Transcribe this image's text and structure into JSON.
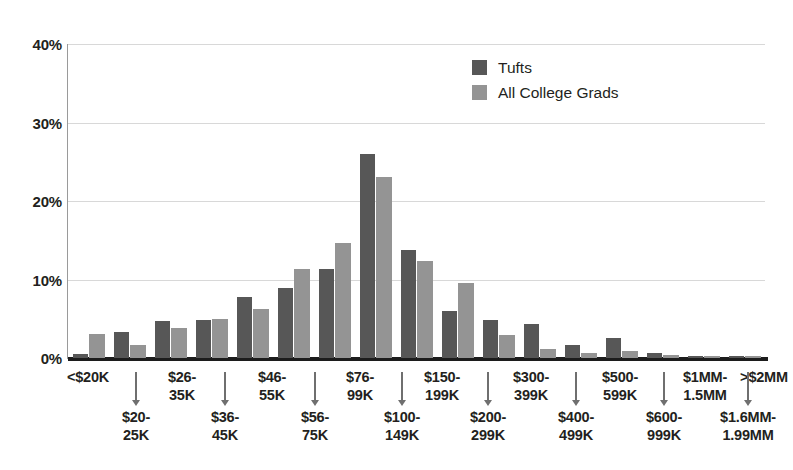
{
  "chart_data": {
    "type": "bar",
    "title": "",
    "xlabel": "",
    "ylabel": "",
    "ylim": [
      0,
      40
    ],
    "yticks": [
      0,
      10,
      20,
      30,
      40
    ],
    "ytick_labels": [
      "0%",
      "10%",
      "20%",
      "30%",
      "40%"
    ],
    "grid": true,
    "legend_position": "top-right",
    "categories": [
      "<$20K",
      "$20-25K",
      "$26-35K",
      "$36-45K",
      "$46-55K",
      "$56-75K",
      "$76-99K",
      "$100-149K",
      "$150-199K",
      "$200-299K",
      "$300-399K",
      "$400-499K",
      "$500-599K",
      "$600-999K",
      "$1MM-1.5MM",
      "$1.6MM-1.99MM",
      ">$2MM"
    ],
    "series": [
      {
        "name": "Tufts",
        "color": "#575757",
        "values": [
          0.5,
          3.3,
          4.7,
          4.8,
          7.8,
          8.9,
          11.3,
          26.0,
          13.7,
          6.0,
          4.8,
          4.3,
          1.7,
          2.5,
          0.7,
          0.2,
          0.2
        ]
      },
      {
        "name": "All College Grads",
        "color": "#949494",
        "values": [
          3.0,
          1.7,
          3.8,
          5.0,
          6.2,
          11.3,
          14.7,
          23.0,
          12.3,
          9.5,
          2.9,
          1.2,
          0.6,
          0.9,
          0.4,
          0.2,
          0.3
        ]
      }
    ]
  },
  "axis": {
    "y_ticks": [
      {
        "label": "40%",
        "value": 40
      },
      {
        "label": "30%",
        "value": 30
      },
      {
        "label": "20%",
        "value": 20
      },
      {
        "label": "10%",
        "value": 10
      },
      {
        "label": "0%",
        "value": 0
      }
    ]
  },
  "legend": {
    "items": [
      {
        "label": "Tufts",
        "color": "#575757"
      },
      {
        "label": "All College Grads",
        "color": "#949494"
      }
    ]
  },
  "x_axis_labels": {
    "top_row": [
      {
        "text": "<$20K",
        "center": 88
      },
      {
        "text": "$26-\n35K",
        "line1": "$26-",
        "line2": "35K",
        "center": 182
      },
      {
        "text": "$46-\n55K",
        "line1": "$46-",
        "line2": "55K",
        "center": 272
      },
      {
        "text": "$76-\n99K",
        "line1": "$76-",
        "line2": "99K",
        "center": 360
      },
      {
        "text": "$150-\n199K",
        "line1": "$150-",
        "line2": "199K",
        "center": 442
      },
      {
        "text": "$300-\n399K",
        "line1": "$300-",
        "line2": "399K",
        "center": 531
      },
      {
        "text": "$500-\n599K",
        "line1": "$500-",
        "line2": "599K",
        "center": 620
      },
      {
        "text": "$1MM-\n1.5MM",
        "line1": "$1MM-",
        "line2": "1.5MM",
        "center": 705
      },
      {
        "text": ">$2MM",
        "center": 764
      }
    ],
    "bottom_row": [
      {
        "line1": "$20-",
        "line2": "25K",
        "center": 136
      },
      {
        "line1": "$36-",
        "line2": "45K",
        "center": 225
      },
      {
        "line1": "$56-",
        "line2": "75K",
        "center": 315
      },
      {
        "line1": "$100-",
        "line2": "149K",
        "center": 402
      },
      {
        "line1": "$200-",
        "line2": "299K",
        "center": 488
      },
      {
        "line1": "$400-",
        "line2": "499K",
        "center": 576
      },
      {
        "line1": "$600-",
        "line2": "999K",
        "center": 664
      },
      {
        "line1": "$1.6MM-",
        "line2": "1.99MM",
        "center": 748
      }
    ],
    "arrows": [
      136,
      225,
      315,
      402,
      488,
      576,
      664,
      748
    ]
  },
  "colors": {
    "tufts_bar": "#575757",
    "grads_bar": "#949494",
    "gridline": "#d8d8d8",
    "axis_line": "#1c1c1c",
    "text": "#231f20",
    "background": "#ffffff"
  }
}
